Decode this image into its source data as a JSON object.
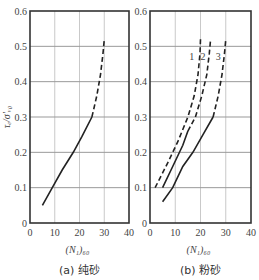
{
  "chart_data": [
    {
      "type": "line",
      "title": "",
      "caption": "(a) 纯砂",
      "xlabel": "(N₁)₆₀",
      "ylabel": "τₑ/σ'ᵥ₀",
      "xlim": [
        0,
        40
      ],
      "ylim": [
        0,
        0.6
      ],
      "xticks": [
        0,
        10,
        20,
        30,
        40
      ],
      "yticks": [
        0,
        0.1,
        0.2,
        0.3,
        0.4,
        0.5,
        0.6
      ],
      "grid": true,
      "series": [
        {
          "name": "curve",
          "segments": [
            {
              "style": "solid",
              "points": [
                [
                  5,
                  0.05
                ],
                [
                  9,
                  0.1
                ],
                [
                  13,
                  0.15
                ],
                [
                  17.5,
                  0.2
                ],
                [
                  21,
                  0.245
                ],
                [
                  25,
                  0.3
                ]
              ]
            },
            {
              "style": "dashed",
              "points": [
                [
                  25,
                  0.3
                ],
                [
                  27,
                  0.36
                ],
                [
                  28.5,
                  0.42
                ],
                [
                  29.5,
                  0.48
                ],
                [
                  30,
                  0.52
                ]
              ]
            }
          ]
        }
      ]
    },
    {
      "type": "line",
      "title": "",
      "caption": "(b) 粉砂",
      "xlabel": "(N₁)₆₀",
      "ylabel": "",
      "xlim": [
        0,
        40
      ],
      "ylim": [
        0,
        0.6
      ],
      "xticks": [
        0,
        10,
        20,
        30,
        40
      ],
      "yticks": [
        0,
        0.1,
        0.2,
        0.3,
        0.4,
        0.5,
        0.6
      ],
      "grid": true,
      "annotations": [
        "1",
        "2",
        "3"
      ],
      "series": [
        {
          "name": "1",
          "segments": [
            {
              "style": "dashed",
              "points": [
                [
                  2,
                  0.1
                ],
                [
                  7,
                  0.17
                ],
                [
                  11,
                  0.23
                ],
                [
                  15,
                  0.3
                ],
                [
                  17.5,
                  0.36
                ],
                [
                  19,
                  0.42
                ],
                [
                  19.8,
                  0.48
                ],
                [
                  20,
                  0.52
                ]
              ]
            }
          ]
        },
        {
          "name": "2",
          "segments": [
            {
              "style": "solid",
              "points": [
                [
                  5,
                  0.1
                ],
                [
                  9,
                  0.16
                ],
                [
                  13,
                  0.22
                ],
                [
                  15,
                  0.26
                ]
              ]
            },
            {
              "style": "dashed",
              "points": [
                [
                  15,
                  0.26
                ],
                [
                  18,
                  0.3
                ],
                [
                  20.5,
                  0.36
                ],
                [
                  22.5,
                  0.42
                ],
                [
                  23.5,
                  0.48
                ],
                [
                  24,
                  0.52
                ]
              ]
            }
          ]
        },
        {
          "name": "3",
          "segments": [
            {
              "style": "solid",
              "points": [
                [
                  5,
                  0.06
                ],
                [
                  9,
                  0.1
                ],
                [
                  13,
                  0.16
                ],
                [
                  17,
                  0.2
                ],
                [
                  21,
                  0.25
                ],
                [
                  25,
                  0.3
                ]
              ]
            },
            {
              "style": "dashed",
              "points": [
                [
                  25,
                  0.3
                ],
                [
                  27,
                  0.36
                ],
                [
                  28.5,
                  0.42
                ],
                [
                  29.5,
                  0.48
                ],
                [
                  30,
                  0.52
                ]
              ]
            }
          ]
        }
      ]
    }
  ],
  "panels": {
    "a": {
      "caption": "(a) 纯砂",
      "xlabel": "(N₁)₆₀",
      "ylabel": "τₑ/σ'ᵥ₀",
      "yticks": [
        "0",
        "0.1",
        "0.2",
        "0.3",
        "0.4",
        "0.5",
        "0.6"
      ],
      "xticks": [
        "0",
        "10",
        "20",
        "30",
        "40"
      ]
    },
    "b": {
      "caption": "(b) 粉砂",
      "xlabel": "(N₁)₆₀",
      "yticks": [
        "0",
        "0.1",
        "0.2",
        "0.3",
        "0.4",
        "0.5",
        "0.6"
      ],
      "xticks": [
        "0",
        "10",
        "20",
        "30",
        "40"
      ],
      "curve_labels": [
        "1",
        "2",
        "3"
      ]
    }
  }
}
